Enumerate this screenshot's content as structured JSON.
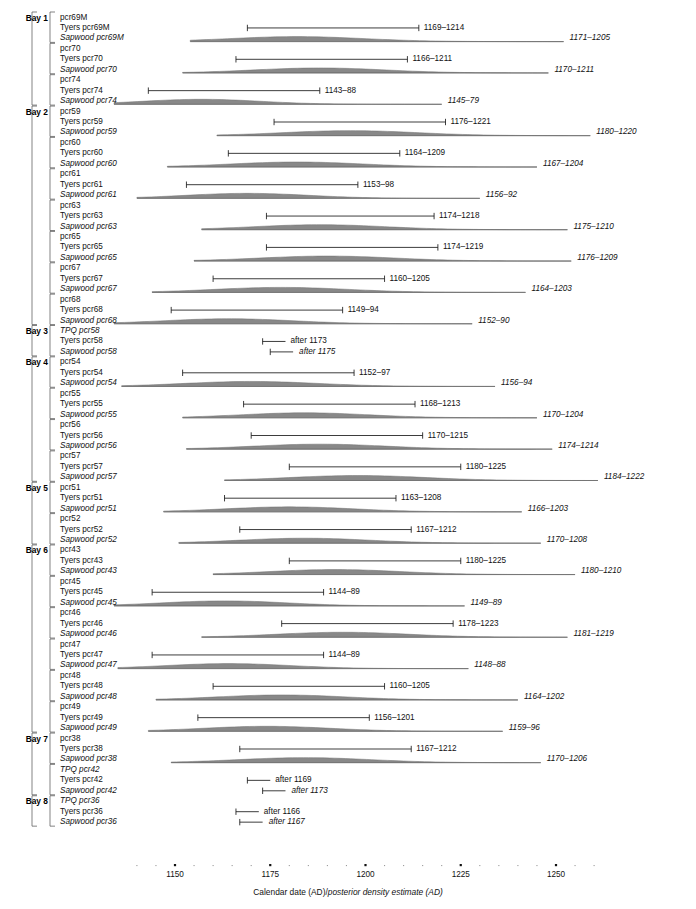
{
  "figure": {
    "axis_caption_plain_1": "Calendar date (AD)/",
    "axis_caption_italic_1": "posterior density estimate (AD)",
    "axis_tick_labels": [
      "1150",
      "1175",
      "1200",
      "1225",
      "1250"
    ],
    "axis_tick_values": [
      1150,
      1175,
      1200,
      1225,
      1250
    ],
    "colors": {
      "line": "#1a1a1a",
      "density_fill": "#6e6e6e",
      "density_baseline": "#5a5a5a",
      "bracket": "#4d4d4d",
      "text": "#111111"
    }
  },
  "chart_data": {
    "type": "bar",
    "title": "",
    "xlabel": "Calendar date (AD)/posterior density estimate (AD)",
    "ylabel": "",
    "xlim": [
      1133,
      1262
    ],
    "grid": false,
    "legend": "none",
    "bays": [
      {
        "bay": "Bay 1",
        "groups": [
          {
            "name": "pcr69M",
            "tyers": {
              "label": "Tyers pcr69M",
              "range_text": "1169–1214",
              "start": 1169,
              "end": 1214,
              "open": false
            },
            "sapwood": {
              "label": "Sapwood pcr69M",
              "range_text": "1171–1205",
              "start": 1171,
              "end": 1205,
              "dist_start": 1154,
              "dist_end": 1252,
              "peak": 1182
            }
          },
          {
            "name": "pcr70",
            "tyers": {
              "label": "Tyers pcr70",
              "range_text": "1166–1211",
              "start": 1166,
              "end": 1211,
              "open": false
            },
            "sapwood": {
              "label": "Sapwood pcr70",
              "range_text": "1170–1211",
              "start": 1170,
              "end": 1211,
              "dist_start": 1152,
              "dist_end": 1248,
              "peak": 1188
            }
          },
          {
            "name": "pcr74",
            "tyers": {
              "label": "Tyers pcr74",
              "range_text": "1143–88",
              "start": 1143,
              "end": 1188,
              "open": false
            },
            "sapwood": {
              "label": "Sapwood pcr74",
              "range_text": "1145–79",
              "start": 1145,
              "end": 1179,
              "dist_start": 1134,
              "dist_end": 1220,
              "peak": 1157
            }
          }
        ]
      },
      {
        "bay": "Bay 2",
        "groups": [
          {
            "name": "pcr59",
            "tyers": {
              "label": "Tyers pcr59",
              "range_text": "1176–1221",
              "start": 1176,
              "end": 1221,
              "open": false
            },
            "sapwood": {
              "label": "Sapwood pcr59",
              "range_text": "1180–1220",
              "start": 1180,
              "end": 1220,
              "dist_start": 1161,
              "dist_end": 1259,
              "peak": 1196
            }
          },
          {
            "name": "pcr60",
            "tyers": {
              "label": "Tyers pcr60",
              "range_text": "1164–1209",
              "start": 1164,
              "end": 1209,
              "open": false
            },
            "sapwood": {
              "label": "Sapwood pcr60",
              "range_text": "1167–1204",
              "start": 1167,
              "end": 1204,
              "dist_start": 1148,
              "dist_end": 1245,
              "peak": 1182
            }
          },
          {
            "name": "pcr61",
            "tyers": {
              "label": "Tyers pcr61",
              "range_text": "1153–98",
              "start": 1153,
              "end": 1198,
              "open": false
            },
            "sapwood": {
              "label": "Sapwood pcr61",
              "range_text": "1156–92",
              "start": 1156,
              "end": 1192,
              "dist_start": 1140,
              "dist_end": 1230,
              "peak": 1169
            }
          },
          {
            "name": "pcr63",
            "tyers": {
              "label": "Tyers pcr63",
              "range_text": "1174–1218",
              "start": 1174,
              "end": 1218,
              "open": false
            },
            "sapwood": {
              "label": "Sapwood pcr63",
              "range_text": "1175–1210",
              "start": 1175,
              "end": 1210,
              "dist_start": 1157,
              "dist_end": 1253,
              "peak": 1188
            }
          },
          {
            "name": "pcr65",
            "tyers": {
              "label": "Tyers pcr65",
              "range_text": "1174–1219",
              "start": 1174,
              "end": 1219,
              "open": false
            },
            "sapwood": {
              "label": "Sapwood pcr65",
              "range_text": "1176–1209",
              "start": 1176,
              "end": 1209,
              "dist_start": 1155,
              "dist_end": 1254,
              "peak": 1190
            }
          },
          {
            "name": "pcr67",
            "tyers": {
              "label": "Tyers pcr67",
              "range_text": "1160–1205",
              "start": 1160,
              "end": 1205,
              "open": false
            },
            "sapwood": {
              "label": "Sapwood pcr67",
              "range_text": "1164–1203",
              "start": 1164,
              "end": 1203,
              "dist_start": 1144,
              "dist_end": 1242,
              "peak": 1178
            }
          },
          {
            "name": "pcr68",
            "tyers": {
              "label": "Tyers pcr68",
              "range_text": "1149–94",
              "start": 1149,
              "end": 1194,
              "open": false
            },
            "sapwood": {
              "label": "Sapwood pcr68",
              "range_text": "1152–90",
              "start": 1152,
              "end": 1190,
              "dist_start": 1134,
              "dist_end": 1228,
              "peak": 1164
            }
          }
        ]
      },
      {
        "bay": "Bay 3",
        "groups": [
          {
            "name": "TPQ pcr58",
            "name_italic": true,
            "tyers": {
              "label": "Tyers pcr58",
              "range_text": "after 1173",
              "start": 1173,
              "end": 1179,
              "open": true
            },
            "sapwood": {
              "label": "Sapwood pcr58",
              "range_text": "after 1175",
              "start": 1175,
              "end": 1181,
              "open": true,
              "italic": true
            }
          }
        ]
      },
      {
        "bay": "Bay 4",
        "groups": [
          {
            "name": "pcr54",
            "tyers": {
              "label": "Tyers pcr54",
              "range_text": "1152–97",
              "start": 1152,
              "end": 1197,
              "open": false
            },
            "sapwood": {
              "label": "Sapwood pcr54",
              "range_text": "1156–94",
              "start": 1156,
              "end": 1194,
              "dist_start": 1136,
              "dist_end": 1234,
              "peak": 1170
            }
          },
          {
            "name": "pcr55",
            "tyers": {
              "label": "Tyers pcr55",
              "range_text": "1168–1213",
              "start": 1168,
              "end": 1213,
              "open": false
            },
            "sapwood": {
              "label": "Sapwood pcr55",
              "range_text": "1170–1204",
              "start": 1170,
              "end": 1204,
              "dist_start": 1152,
              "dist_end": 1245,
              "peak": 1184
            }
          },
          {
            "name": "pcr56",
            "tyers": {
              "label": "Tyers pcr56",
              "range_text": "1170–1215",
              "start": 1170,
              "end": 1215,
              "open": false
            },
            "sapwood": {
              "label": "Sapwood pcr56",
              "range_text": "1174–1214",
              "start": 1174,
              "end": 1214,
              "dist_start": 1153,
              "dist_end": 1249,
              "peak": 1188
            }
          },
          {
            "name": "pcr57",
            "tyers": {
              "label": "Tyers pcr57",
              "range_text": "1180–1225",
              "start": 1180,
              "end": 1225,
              "open": false
            },
            "sapwood": {
              "label": "Sapwood pcr57",
              "range_text": "1184–1222",
              "start": 1184,
              "end": 1222,
              "dist_start": 1163,
              "dist_end": 1261,
              "peak": 1198
            }
          }
        ]
      },
      {
        "bay": "Bay 5",
        "groups": [
          {
            "name": "pcr51",
            "tyers": {
              "label": "Tyers pcr51",
              "range_text": "1163–1208",
              "start": 1163,
              "end": 1208,
              "open": false
            },
            "sapwood": {
              "label": "Sapwood pcr51",
              "range_text": "1166–1203",
              "start": 1166,
              "end": 1203,
              "dist_start": 1147,
              "dist_end": 1241,
              "peak": 1180
            }
          },
          {
            "name": "pcr52",
            "tyers": {
              "label": "Tyers pcr52",
              "range_text": "1167–1212",
              "start": 1167,
              "end": 1212,
              "open": false
            },
            "sapwood": {
              "label": "Sapwood pcr52",
              "range_text": "1170–1208",
              "start": 1170,
              "end": 1208,
              "dist_start": 1151,
              "dist_end": 1246,
              "peak": 1184
            }
          }
        ]
      },
      {
        "bay": "Bay 6",
        "groups": [
          {
            "name": "pcr43",
            "tyers": {
              "label": "Tyers pcr43",
              "range_text": "1180–1225",
              "start": 1180,
              "end": 1225,
              "open": false
            },
            "sapwood": {
              "label": "Sapwood pcr43",
              "range_text": "1180–1210",
              "start": 1180,
              "end": 1210,
              "dist_start": 1160,
              "dist_end": 1255,
              "peak": 1192
            }
          },
          {
            "name": "pcr45",
            "tyers": {
              "label": "Tyers pcr45",
              "range_text": "1144–89",
              "start": 1144,
              "end": 1189,
              "open": false
            },
            "sapwood": {
              "label": "Sapwood pcr45",
              "range_text": "1149–89",
              "start": 1149,
              "end": 1189,
              "dist_start": 1134,
              "dist_end": 1226,
              "peak": 1163
            }
          },
          {
            "name": "pcr46",
            "tyers": {
              "label": "Tyers pcr46",
              "range_text": "1178–1223",
              "start": 1178,
              "end": 1223,
              "open": false
            },
            "sapwood": {
              "label": "Sapwood pcr46",
              "range_text": "1181–1219",
              "start": 1181,
              "end": 1219,
              "dist_start": 1157,
              "dist_end": 1253,
              "peak": 1194
            }
          },
          {
            "name": "pcr47",
            "tyers": {
              "label": "Tyers pcr47",
              "range_text": "1144–89",
              "start": 1144,
              "end": 1189,
              "open": false
            },
            "sapwood": {
              "label": "Sapwood pcr47",
              "range_text": "1148–88",
              "start": 1148,
              "end": 1188,
              "dist_start": 1135,
              "dist_end": 1227,
              "peak": 1164
            }
          },
          {
            "name": "pcr48",
            "tyers": {
              "label": "Tyers pcr48",
              "range_text": "1160–1205",
              "start": 1160,
              "end": 1205,
              "open": false
            },
            "sapwood": {
              "label": "Sapwood pcr48",
              "range_text": "1164–1202",
              "start": 1164,
              "end": 1202,
              "dist_start": 1145,
              "dist_end": 1240,
              "peak": 1178
            }
          },
          {
            "name": "pcr49",
            "tyers": {
              "label": "Tyers pcr49",
              "range_text": "1156–1201",
              "start": 1156,
              "end": 1201,
              "open": false
            },
            "sapwood": {
              "label": "Sapwood pcr49",
              "range_text": "1159–96",
              "start": 1159,
              "end": 1196,
              "dist_start": 1143,
              "dist_end": 1236,
              "peak": 1174
            }
          }
        ]
      },
      {
        "bay": "Bay 7",
        "groups": [
          {
            "name": "pcr38",
            "tyers": {
              "label": "Tyers pcr38",
              "range_text": "1167–1212",
              "start": 1167,
              "end": 1212,
              "open": false
            },
            "sapwood": {
              "label": "Sapwood pcr38",
              "range_text": "1170–1206",
              "start": 1170,
              "end": 1206,
              "dist_start": 1149,
              "dist_end": 1246,
              "peak": 1184
            }
          },
          {
            "name": "TPQ pcr42",
            "name_italic": true,
            "tyers": {
              "label": "Tyers pcr42",
              "range_text": "after 1169",
              "start": 1169,
              "end": 1175,
              "open": true
            },
            "sapwood": {
              "label": "Sapwood pcr42",
              "range_text": "after 1173",
              "start": 1173,
              "end": 1179,
              "open": true,
              "italic": true
            }
          }
        ]
      },
      {
        "bay": "Bay 8",
        "groups": [
          {
            "name": "TPQ pcr36",
            "name_italic": true,
            "tyers": {
              "label": "Tyers pcr36",
              "range_text": "after 1166",
              "start": 1166,
              "end": 1172,
              "open": true
            },
            "sapwood": {
              "label": "Sapwood pcr36",
              "range_text": "after 1167",
              "start": 1167,
              "end": 1173,
              "open": true,
              "italic": true
            }
          }
        ]
      }
    ]
  }
}
